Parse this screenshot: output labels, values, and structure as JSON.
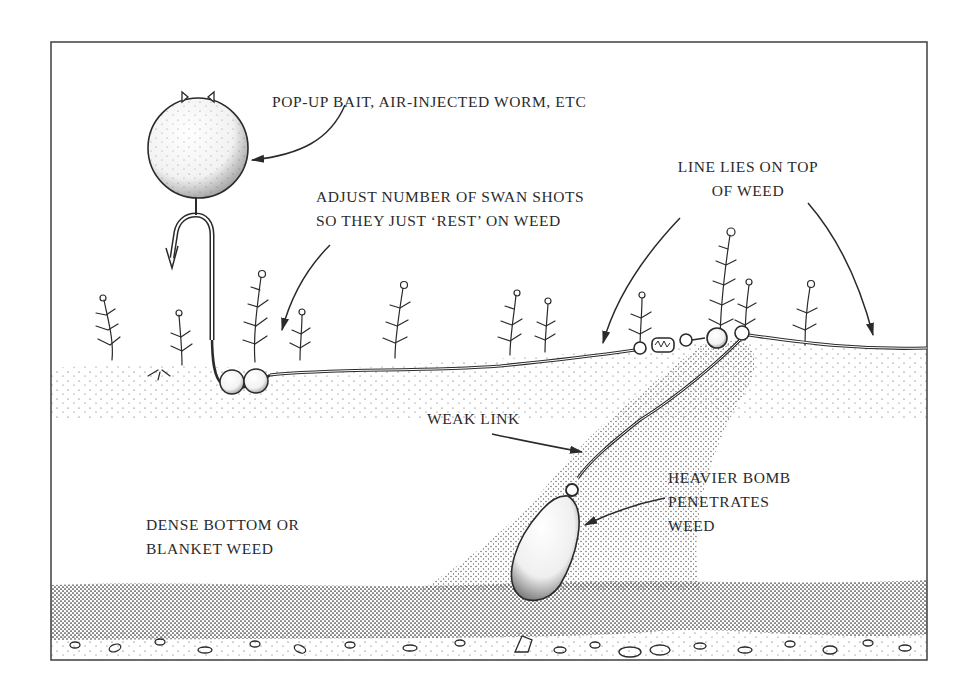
{
  "diagram": {
    "colors": {
      "ink": "#2a2a2a",
      "paper": "#ffffff",
      "stipple": "#3a3a3a"
    },
    "labels": {
      "pop_up_bait": {
        "lines": [
          "POP-UP BAIT, AIR-INJECTED WORM, ETC"
        ]
      },
      "swan_shots": {
        "lines": [
          "ADJUST NUMBER OF SWAN SHOTS",
          "SO THEY JUST ‘REST’ ON WEED"
        ]
      },
      "line_on_weed": {
        "lines": [
          "LINE LIES ON TOP",
          "OF WEED"
        ]
      },
      "weak_link": {
        "lines": [
          "WEAK LINK"
        ]
      },
      "heavier_bomb": {
        "lines": [
          "HEAVIER BOMB",
          "PENETRATES",
          "WEED"
        ]
      },
      "dense_bottom": {
        "lines": [
          "DENSE BOTTOM OR",
          "BLANKET WEED"
        ]
      }
    },
    "components": [
      {
        "name": "pop-up-bait",
        "shape": "sphere"
      },
      {
        "name": "hook",
        "shape": "hook"
      },
      {
        "name": "swan-shots",
        "count": 2
      },
      {
        "name": "swivel",
        "shape": "barrel-swivel"
      },
      {
        "name": "bead",
        "shape": "ball"
      },
      {
        "name": "weak-link",
        "shape": "line"
      },
      {
        "name": "bomb-lead",
        "shape": "pear"
      },
      {
        "name": "weed-fronds",
        "count": 12
      }
    ]
  }
}
